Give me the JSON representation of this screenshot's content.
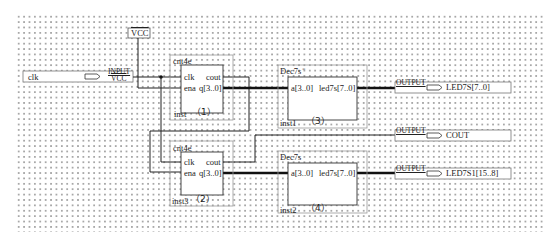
{
  "diagram": {
    "type": "schematic",
    "background": "#ffffff",
    "grid_color": "#a8a8a8",
    "wire_color": "#222222",
    "block_border_color": "#9a9a9a"
  },
  "power": {
    "vcc_label": "VCC"
  },
  "inputs": [
    {
      "name": "clk",
      "pin_type": "INPUT",
      "default": "VCC"
    }
  ],
  "outputs": [
    {
      "name": "LED7S[7..0]",
      "pin_type": "OUTPUT"
    },
    {
      "name": "COUT",
      "pin_type": "OUTPUT"
    },
    {
      "name": "LED7S1[15..8]",
      "pin_type": "OUTPUT"
    }
  ],
  "blocks": [
    {
      "module": "cnt4e",
      "instance": "inst",
      "tag": "（1）",
      "ports_left": [
        "clk",
        "ena"
      ],
      "ports_right": [
        "cout",
        "q[3..0]"
      ]
    },
    {
      "module": "cnt4e",
      "instance": "inst3",
      "tag": "（2）",
      "ports_left": [
        "clk",
        "ena"
      ],
      "ports_right": [
        "cout",
        "q[3..0]"
      ]
    },
    {
      "module": "Dec7s",
      "instance": "inst1",
      "tag": "（3）",
      "marker": "*",
      "ports_left": [
        "a[3..0]"
      ],
      "ports_right": [
        "led7s[7..0]"
      ]
    },
    {
      "module": "Dec7s",
      "instance": "inst2",
      "tag": "（4）",
      "ports_left": [
        "a[3..0]"
      ],
      "ports_right": [
        "led7s[7..0]"
      ]
    }
  ]
}
